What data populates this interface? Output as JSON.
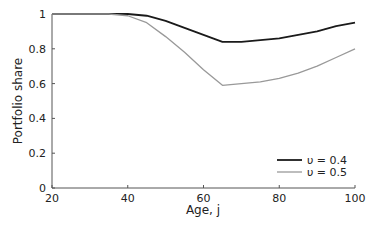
{
  "chart_data": {
    "type": "line",
    "title": "",
    "xlabel": "Age, j",
    "ylabel": "Portfolio share",
    "xlim": [
      20,
      100
    ],
    "ylim": [
      0,
      1
    ],
    "xticks": [
      "20",
      "40",
      "60",
      "80",
      "100"
    ],
    "yticks": [
      "0",
      "0.2",
      "0.4",
      "0.6",
      "0.8",
      "1"
    ],
    "grid": false,
    "legend_position": "lower right",
    "x": [
      20,
      30,
      35,
      40,
      45,
      50,
      55,
      60,
      65,
      70,
      75,
      80,
      85,
      90,
      95,
      100
    ],
    "series": [
      {
        "name": "υ = 0.4",
        "color": "#1a1a1a",
        "values": [
          1.0,
          1.0,
          1.0,
          1.0,
          0.99,
          0.96,
          0.92,
          0.88,
          0.84,
          0.84,
          0.85,
          0.86,
          0.88,
          0.9,
          0.93,
          0.95
        ]
      },
      {
        "name": "υ = 0.5",
        "color": "#999999",
        "values": [
          1.0,
          1.0,
          1.0,
          0.99,
          0.95,
          0.87,
          0.78,
          0.68,
          0.59,
          0.6,
          0.61,
          0.63,
          0.66,
          0.7,
          0.75,
          0.8
        ]
      }
    ]
  }
}
